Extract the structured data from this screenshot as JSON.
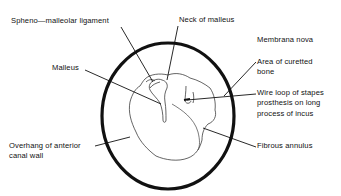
{
  "diagram": {
    "colors": {
      "ink": "#111111",
      "background": "#ffffff"
    },
    "labels": {
      "spheno_malleolar": {
        "lines": [
          "Spheno—malleolar ligament"
        ]
      },
      "neck_of_malleus": {
        "lines": [
          "Neck of malleus"
        ]
      },
      "membrana_nova": {
        "lines": [
          "Membrana nova"
        ]
      },
      "curetted_bone": {
        "lines": [
          "Area of curetted",
          "bone"
        ]
      },
      "malleus": {
        "lines": [
          "Malleus"
        ]
      },
      "wire_loop": {
        "lines": [
          "Wire loop of stapes",
          "prosthesis on long",
          "process of incus"
        ]
      },
      "overhang": {
        "lines": [
          "Overhang of anterior",
          "canal wall"
        ]
      },
      "fibrous_annulus": {
        "lines": [
          "Fibrous annulus"
        ]
      }
    }
  }
}
